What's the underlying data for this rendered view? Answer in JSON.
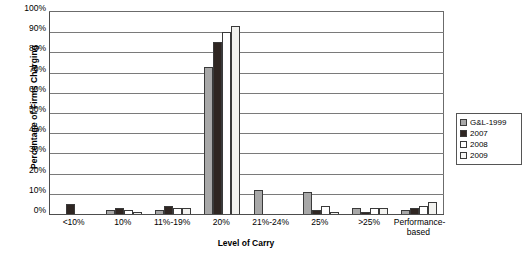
{
  "chart_data": {
    "type": "bar",
    "title": "",
    "xlabel": "Level of Carry",
    "ylabel": "Percentage of Firms Charging",
    "ylim": [
      0,
      100
    ],
    "ytick_labels": [
      "0%",
      "10%",
      "20%",
      "30%",
      "40%",
      "50%",
      "60%",
      "70%",
      "80%",
      "90%",
      "100%"
    ],
    "ytick_values": [
      0,
      10,
      20,
      30,
      40,
      50,
      60,
      70,
      80,
      90,
      100
    ],
    "grid": "horizontal",
    "legend_position": "right",
    "categories": [
      "<10%",
      "10%",
      "11%-19%",
      "20%",
      "21%-24%",
      "25%",
      ">25%",
      "Performance-based"
    ],
    "series": [
      {
        "name": "G&L-1999",
        "color": "#a8a8a8",
        "values": [
          0,
          2,
          2,
          73,
          12,
          11,
          3,
          2
        ]
      },
      {
        "name": "2007",
        "color": "#2f2622",
        "values": [
          5,
          3,
          4,
          85,
          0,
          2,
          1,
          3
        ]
      },
      {
        "name": "2008",
        "color": "#ffffff",
        "values": [
          0,
          2,
          3,
          90,
          0,
          4,
          3,
          4
        ]
      },
      {
        "name": "2009",
        "color": "#f2f2ef",
        "values": [
          0,
          1,
          3,
          93,
          0,
          1,
          3,
          6
        ]
      }
    ]
  },
  "legend": {
    "items": [
      {
        "label": "G&L-1999"
      },
      {
        "label": "2007"
      },
      {
        "label": "2008"
      },
      {
        "label": "2009"
      }
    ]
  }
}
